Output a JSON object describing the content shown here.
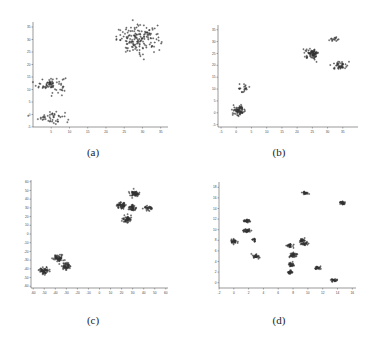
{
  "chart_data": [
    {
      "type": "scatter",
      "title": "",
      "caption": "(a)",
      "xlabel": "",
      "ylabel": "",
      "xlim": [
        0,
        37
      ],
      "ylim": [
        -5,
        37
      ],
      "xticks": [
        5,
        10,
        15,
        20,
        25,
        30,
        35
      ],
      "yticks": [
        -5,
        0,
        5,
        10,
        15,
        20,
        25,
        30,
        35
      ],
      "grid": false,
      "clusters": [
        {
          "center": [
            5,
            12
          ],
          "spread": [
            2.0,
            1.6
          ],
          "n": 70
        },
        {
          "center": [
            5,
            -1
          ],
          "spread": [
            1.8,
            1.3
          ],
          "n": 45
        },
        {
          "center": [
            29,
            30
          ],
          "spread": [
            3.0,
            2.6
          ],
          "n": 160
        }
      ]
    },
    {
      "type": "scatter",
      "title": "",
      "caption": "(b)",
      "xlabel": "",
      "ylabel": "",
      "xlim": [
        -6,
        40
      ],
      "ylim": [
        -6,
        37
      ],
      "xticks": [
        -5,
        0,
        5,
        10,
        15,
        20,
        25,
        30,
        35
      ],
      "yticks": [
        -5,
        0,
        5,
        10,
        15,
        20,
        25,
        30,
        35
      ],
      "grid": false,
      "clusters": [
        {
          "center": [
            1,
            1
          ],
          "spread": [
            1.0,
            1.0
          ],
          "n": 70
        },
        {
          "center": [
            2,
            10
          ],
          "spread": [
            1.2,
            1.0
          ],
          "n": 20
        },
        {
          "center": [
            25,
            25
          ],
          "spread": [
            1.1,
            1.0
          ],
          "n": 80
        },
        {
          "center": [
            34,
            20
          ],
          "spread": [
            1.0,
            0.9
          ],
          "n": 45
        },
        {
          "center": [
            32,
            31
          ],
          "spread": [
            1.1,
            0.5
          ],
          "n": 15
        }
      ]
    },
    {
      "type": "scatter",
      "title": "",
      "caption": "(c)",
      "xlabel": "",
      "ylabel": "",
      "xlim": [
        -62,
        62
      ],
      "ylim": [
        -62,
        62
      ],
      "xticks": [
        -60,
        -50,
        -40,
        -30,
        -20,
        -10,
        0,
        10,
        20,
        30,
        40,
        50,
        60
      ],
      "yticks": [
        -60,
        -50,
        -40,
        -30,
        -20,
        -10,
        0,
        10,
        20,
        30,
        40,
        50,
        60
      ],
      "grid": false,
      "clusters": [
        {
          "center": [
            -50,
            -42
          ],
          "spread": [
            2.2,
            2.0
          ],
          "n": 60
        },
        {
          "center": [
            -37,
            -28
          ],
          "spread": [
            2.2,
            2.0
          ],
          "n": 60
        },
        {
          "center": [
            -30,
            -37
          ],
          "spread": [
            2.2,
            2.0
          ],
          "n": 50
        },
        {
          "center": [
            20,
            33
          ],
          "spread": [
            2.0,
            2.0
          ],
          "n": 55
        },
        {
          "center": [
            32,
            46
          ],
          "spread": [
            2.0,
            1.7
          ],
          "n": 55
        },
        {
          "center": [
            30,
            30
          ],
          "spread": [
            1.8,
            1.8
          ],
          "n": 45
        },
        {
          "center": [
            44,
            30
          ],
          "spread": [
            2.2,
            1.6
          ],
          "n": 30
        },
        {
          "center": [
            25,
            17
          ],
          "spread": [
            2.0,
            1.8
          ],
          "n": 55
        }
      ]
    },
    {
      "type": "scatter",
      "title": "",
      "caption": "(d)",
      "xlabel": "",
      "ylabel": "",
      "xlim": [
        -2,
        16.5
      ],
      "ylim": [
        -1,
        19
      ],
      "xticks": [
        -2,
        0,
        2,
        4,
        6,
        8,
        10,
        12,
        14,
        16
      ],
      "yticks": [
        0,
        2,
        4,
        6,
        8,
        10,
        12,
        14,
        16,
        18
      ],
      "grid": false,
      "clusters": [
        {
          "center": [
            0.0,
            7.8
          ],
          "spread": [
            0.22,
            0.22
          ],
          "n": 35
        },
        {
          "center": [
            1.8,
            9.8
          ],
          "spread": [
            0.25,
            0.18
          ],
          "n": 35
        },
        {
          "center": [
            1.8,
            11.6
          ],
          "spread": [
            0.25,
            0.18
          ],
          "n": 30
        },
        {
          "center": [
            2.7,
            8.0
          ],
          "spread": [
            0.15,
            0.2
          ],
          "n": 15
        },
        {
          "center": [
            3.0,
            5.0
          ],
          "spread": [
            0.22,
            0.2
          ],
          "n": 30
        },
        {
          "center": [
            7.6,
            7.0
          ],
          "spread": [
            0.22,
            0.2
          ],
          "n": 30
        },
        {
          "center": [
            8.0,
            5.3
          ],
          "spread": [
            0.28,
            0.25
          ],
          "n": 40
        },
        {
          "center": [
            7.8,
            3.4
          ],
          "spread": [
            0.25,
            0.2
          ],
          "n": 30
        },
        {
          "center": [
            7.6,
            2.0
          ],
          "spread": [
            0.2,
            0.17
          ],
          "n": 25
        },
        {
          "center": [
            9.2,
            8.0
          ],
          "spread": [
            0.2,
            0.2
          ],
          "n": 25
        },
        {
          "center": [
            9.6,
            7.4
          ],
          "spread": [
            0.25,
            0.17
          ],
          "n": 25
        },
        {
          "center": [
            9.6,
            16.9
          ],
          "spread": [
            0.22,
            0.15
          ],
          "n": 25
        },
        {
          "center": [
            11.3,
            2.7
          ],
          "spread": [
            0.2,
            0.17
          ],
          "n": 25
        },
        {
          "center": [
            13.5,
            0.5
          ],
          "spread": [
            0.22,
            0.15
          ],
          "n": 25
        },
        {
          "center": [
            14.6,
            15.0
          ],
          "spread": [
            0.2,
            0.2
          ],
          "n": 30
        }
      ]
    }
  ]
}
